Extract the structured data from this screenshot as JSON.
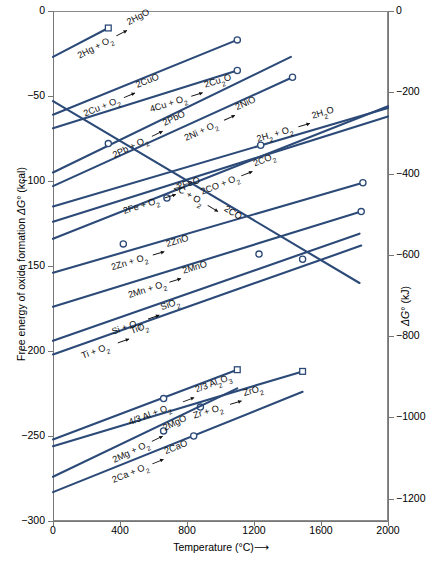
{
  "chart_data": {
    "type": "line",
    "xlabel": "Temperature (°C)",
    "ylabel_left": "Free energy of oxide formation ΔG° (kcal)",
    "ylabel_right": "ΔG° (kJ)",
    "xlim": [
      0,
      2000
    ],
    "ylim_left": [
      -300,
      0
    ],
    "ylim_right": [
      -1255,
      0
    ],
    "grid": false,
    "legend_position": "inline-labels",
    "xticks": [
      "0",
      "400",
      "800",
      "1200",
      "1600",
      "2000"
    ],
    "xtick_values": [
      0,
      400,
      800,
      1200,
      1600,
      2000
    ],
    "yticks_left": [
      "0",
      "-50",
      "-100",
      "-150",
      "-200",
      "-250",
      "-300"
    ],
    "ytick_values_left": [
      0,
      -50,
      -100,
      -150,
      -200,
      -250,
      -300
    ],
    "yticks_right": [
      "0",
      "-200",
      "-400",
      "-600",
      "-800",
      "-1000",
      "-1200"
    ],
    "ytick_values_right": [
      0,
      -200,
      -400,
      -600,
      -800,
      -1000,
      -1200
    ],
    "series": [
      {
        "name": "2Hg + O2 -> 2HgO",
        "label_parts": [
          "2Hg + O",
          "2",
          " ",
          "2HgO"
        ],
        "x": [
          0,
          330
        ],
        "y": [
          -27,
          -10
        ],
        "end_marker": "square",
        "mid_markers": []
      },
      {
        "name": "2Cu + O2 -> 2CuO",
        "label_parts": [
          "2Cu + O",
          "2",
          " ",
          "2CuO"
        ],
        "x": [
          0,
          1100
        ],
        "y": [
          -61,
          -17
        ],
        "end_marker": "circle",
        "mid_markers": []
      },
      {
        "name": "4Cu + O2 -> 2Cu2O",
        "label_parts": [
          "4Cu + O",
          "2",
          " ",
          "2Cu",
          "2",
          "O"
        ],
        "x": [
          0,
          1100
        ],
        "y": [
          -69,
          -35
        ],
        "end_marker": "circle",
        "mid_markers": []
      },
      {
        "name": "2Pb + O2 -> 2PbO",
        "label_parts": [
          "2Pb + O",
          "2",
          " ",
          "2PbO"
        ],
        "x": [
          0,
          1420
        ],
        "y": [
          -95,
          -27
        ],
        "end_marker": "none",
        "mid_markers": [
          [
            330,
            -78
          ]
        ]
      },
      {
        "name": "2Ni + O2 -> 2NiO",
        "label_parts": [
          "2Ni + O",
          "2",
          " ",
          "2NiO"
        ],
        "x": [
          0,
          1430
        ],
        "y": [
          -103,
          -39
        ],
        "end_marker": "circle",
        "mid_markers": []
      },
      {
        "name": "2CO + O2 -> 2CO2",
        "label_parts": [
          "2CO + O",
          "2",
          " ",
          "2CO",
          "2"
        ],
        "x": [
          0,
          2000
        ],
        "y": [
          -134,
          -56
        ],
        "end_marker": "none",
        "mid_markers": []
      },
      {
        "name": "2H2 + O2 -> 2H2O",
        "label_parts": [
          "2H",
          "2",
          " + O",
          "2",
          " ",
          "2H",
          "2",
          "O"
        ],
        "x": [
          0,
          2000
        ],
        "y": [
          -115,
          -57
        ],
        "end_marker": "none",
        "mid_markers": [
          [
            1240,
            -79
          ]
        ]
      },
      {
        "name": "2Fe + O2 -> 2FeO",
        "label_parts": [
          "2Fe + O",
          "2",
          " ",
          "2FeO"
        ],
        "x": [
          0,
          2000
        ],
        "y": [
          -124,
          -62
        ],
        "end_marker": "none",
        "mid_markers": []
      },
      {
        "name": "2C + O2 -> 2CO",
        "label_parts": [
          "2C + O",
          "2",
          " ",
          "2CO"
        ],
        "x": [
          0,
          1830
        ],
        "y": [
          -53,
          -160
        ],
        "end_marker": "none",
        "mid_markers": []
      },
      {
        "name": "2Zn + O2 -> 2ZnO",
        "label_parts": [
          "2Zn + O",
          "2",
          " ",
          "2ZnO"
        ],
        "x": [
          0,
          1850
        ],
        "y": [
          -154,
          -101
        ],
        "end_marker": "circle",
        "mid_markers": [
          [
            420,
            -137
          ]
        ]
      },
      {
        "name": "2Mn + O2 -> 2MnO",
        "label_parts": [
          "2Mn + O",
          "2",
          " ",
          "2MnO"
        ],
        "x": [
          0,
          1840
        ],
        "y": [
          -174,
          -118
        ],
        "end_marker": "circle",
        "mid_markers": [
          [
            680,
            -110
          ]
        ]
      },
      {
        "name": "Si + O2 -> SiO2",
        "label_parts": [
          "Si + O",
          "2",
          " ",
          "SiO",
          "2"
        ],
        "x": [
          0,
          1830
        ],
        "y": [
          -194,
          -131
        ],
        "end_marker": "none",
        "mid_markers": [
          [
            1230,
            -143
          ],
          [
            1490,
            -146
          ]
        ]
      },
      {
        "name": "Ti + O2 -> TiO2",
        "label_parts": [
          "Ti + O",
          "2",
          " ",
          "TiO",
          "2"
        ],
        "x": [
          0,
          1840
        ],
        "y": [
          -202,
          -138
        ],
        "end_marker": "none",
        "mid_markers": []
      },
      {
        "name": "4/3 Al + O2 -> 2/3 Al2O3",
        "label_parts": [
          "4",
          "3",
          "Al + O",
          "2",
          " ",
          "2",
          "3",
          "Al",
          "2",
          "O",
          "3"
        ],
        "x": [
          0,
          1100
        ],
        "y": [
          -252,
          -211
        ],
        "end_marker": "square",
        "mid_markers": [
          [
            660,
            -228
          ]
        ]
      },
      {
        "name": "Zr + O2 -> ZrO2",
        "label_parts": [
          "Zr + O",
          "2",
          " ",
          "ZrO",
          "2"
        ],
        "x": [
          0,
          1490
        ],
        "y": [
          -256,
          -212
        ],
        "end_marker": "square",
        "mid_markers": [
          [
            880,
            -233
          ]
        ]
      },
      {
        "name": "2Mg + O2 -> 2MgO",
        "label_parts": [
          "2Mg + O",
          "2",
          " ",
          "2MgO"
        ],
        "x": [
          0,
          1100
        ],
        "y": [
          -274,
          -222
        ],
        "end_marker": "none",
        "mid_markers": [
          [
            660,
            -247
          ]
        ]
      },
      {
        "name": "2Ca + O2 -> 2CaO",
        "label_parts": [
          "2Ca + O",
          "2",
          " ",
          "2CaO"
        ],
        "x": [
          0,
          1490
        ],
        "y": [
          -283,
          -224
        ],
        "end_marker": "none",
        "mid_markers": [
          [
            840,
            -250
          ]
        ]
      }
    ]
  },
  "axes": {
    "left_title": "Free energy of oxide formation ΔG° (kcal)",
    "right_title": "ΔG° (kJ)",
    "bottom_title": "Temperature (°C)",
    "bottom_title_arrow": "⟶"
  }
}
